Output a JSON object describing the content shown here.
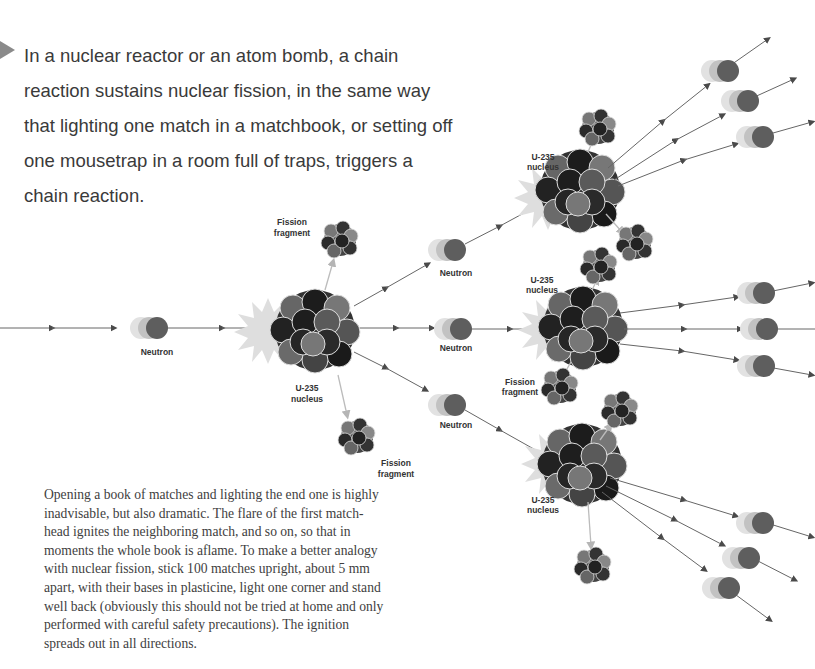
{
  "intro": {
    "bullet_icon": "triangle-right-icon",
    "text": "In a nuclear reactor or an atom bomb, a chain reaction sustains nuclear fission, in the same way that lighting one match in a matchbook, or setting off one mousetrap in a room full of traps, triggers a chain reaction."
  },
  "body": {
    "text": "Opening a book of matches and lighting the end one is highly inadvisable, but also dramatic. The flare of the first match-head ignites the neighboring match, and so on, so that in moments the whole book is aflame. To make a better analogy with nuclear fission, stick 100 matches upright, about 5 mm apart, with their bases in plasticine, light one corner and stand well back (obviously this should not be tried at home and only performed with careful safety precautions). The ignition spreads out in all directions."
  },
  "labels": {
    "neutron": "Neutron",
    "u235_line1": "U-235",
    "u235_line2": "nucleus",
    "fission_line1": "Fission",
    "fission_line2": "fragment"
  },
  "colors": {
    "nucleus_dark": "#1e1e1e",
    "nucleus_mid": "#555555",
    "nucleus_light": "#888888",
    "flash": "#dcdcdc",
    "arrow": "#555555",
    "fragment_arrow": "#b8b8b8",
    "text": "#3a3a3a"
  }
}
